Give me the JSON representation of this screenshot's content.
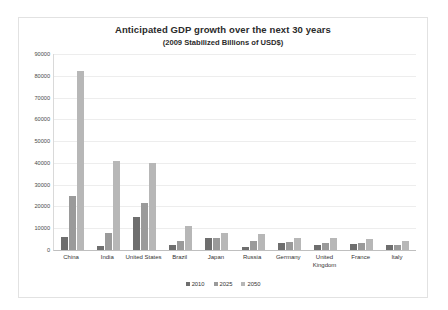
{
  "chart_data": {
    "type": "bar",
    "title": "Anticipated GDP growth over the next 30 years",
    "subtitle": "(2009 Stabilized Billions of USD$)",
    "xlabel": "",
    "ylabel": "",
    "ylim": [
      0,
      90000
    ],
    "ytick_step": 10000,
    "yticks": [
      0,
      10000,
      20000,
      30000,
      40000,
      50000,
      60000,
      70000,
      80000,
      90000
    ],
    "ytick_labels": [
      "0",
      "10000",
      "20000",
      "30000",
      "40000",
      "50000",
      "60000",
      "70000",
      "80000",
      "90000"
    ],
    "grid": true,
    "legend_position": "bottom",
    "categories": [
      "China",
      "India",
      "United States",
      "Brazil",
      "Japan",
      "Russia",
      "Germany",
      "United Kingdom",
      "France",
      "Italy"
    ],
    "series": [
      {
        "name": "2010",
        "color": "#6e6e6e",
        "values": [
          6000,
          2000,
          15000,
          2100,
          5500,
          1600,
          3300,
          2500,
          2700,
          2100
        ]
      },
      {
        "name": "2025",
        "color": "#9a9a9a",
        "values": [
          25000,
          8000,
          21500,
          4000,
          5500,
          4000,
          3700,
          3200,
          3300,
          2400
        ]
      },
      {
        "name": "2050",
        "color": "#b7b7b7",
        "values": [
          82000,
          41000,
          40000,
          11000,
          8000,
          7500,
          5500,
          5500,
          5000,
          4000
        ]
      }
    ]
  }
}
